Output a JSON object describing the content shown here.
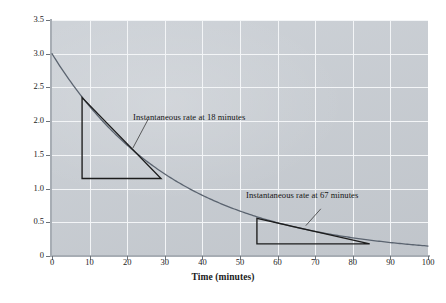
{
  "chart_data": {
    "type": "line",
    "title": "",
    "subtitle": "",
    "xlabel": "Time (minutes)",
    "ylabel": "Concentration (M)",
    "ylabel_plain": "Concentration",
    "ylabel_unit": "M",
    "xlim": [
      0,
      100
    ],
    "ylim": [
      0,
      3.5
    ],
    "grid": true,
    "legend": "none",
    "x_ticks": [
      0,
      10,
      20,
      30,
      40,
      50,
      60,
      70,
      80,
      90,
      100
    ],
    "x_tick_labels": [
      "0",
      "10",
      "20",
      "30",
      "40",
      "50",
      "60",
      "70",
      "80",
      "90",
      "100"
    ],
    "y_ticks": [
      0,
      0.5,
      1.0,
      1.5,
      2.0,
      2.5,
      3.0,
      3.5
    ],
    "y_tick_labels": [
      "0",
      "0.5",
      "1.0",
      "1.5",
      "2.0",
      "2.5",
      "3.0",
      "3.5"
    ],
    "series": [
      {
        "name": "Concentration decay curve",
        "model": "exponential-decay",
        "initial_concentration": 3.0,
        "rate_constant": 0.0301,
        "x": [
          0,
          5,
          10,
          15,
          18,
          20,
          25,
          30,
          35,
          40,
          45,
          50,
          55,
          60,
          65,
          67,
          70,
          75,
          80,
          85,
          90,
          95,
          100
        ],
        "y": [
          3.0,
          2.58,
          2.22,
          1.91,
          1.74,
          1.64,
          1.41,
          1.22,
          1.05,
          0.9,
          0.77,
          0.66,
          0.57,
          0.49,
          0.42,
          0.4,
          0.36,
          0.31,
          0.27,
          0.23,
          0.2,
          0.17,
          0.15
        ]
      }
    ],
    "annotations": [
      {
        "id": "rate-18",
        "text": "Instantaneous rate at 18 minutes",
        "tangent_point": [
          18,
          1.74
        ],
        "triangle": {
          "apex": [
            8,
            2.35
          ],
          "right": [
            29,
            1.15
          ],
          "corner": [
            8,
            1.15
          ],
          "rise": -1.2,
          "run": 21,
          "slope": -0.057
        },
        "leader_from": [
          21.5,
          1.6
        ],
        "leader_to": [
          25.5,
          2.02
        ]
      },
      {
        "id": "rate-67",
        "text": "Instantaneous rate at 67 minutes",
        "tangent_point": [
          67,
          0.4
        ],
        "triangle": {
          "apex": [
            54.5,
            0.56
          ],
          "right": [
            84.5,
            0.18
          ],
          "corner": [
            54.5,
            0.18
          ],
          "rise": -0.38,
          "run": 30,
          "slope": -0.0127
        },
        "leader_from": [
          67.5,
          0.45
        ],
        "leader_to": [
          71.5,
          0.7
        ]
      }
    ],
    "colors": {
      "plot_background": "#c9ced4",
      "gridline": "#f3f5f7",
      "curve": "#5b6470",
      "tangent": "#1c1c1c",
      "axis": "#a7adb4",
      "text": "#1a1a1a",
      "page_background": "#ffffff"
    }
  }
}
